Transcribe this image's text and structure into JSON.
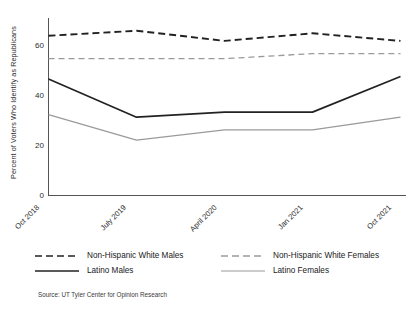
{
  "chart_data": {
    "type": "line",
    "title": "",
    "xlabel": "",
    "ylabel": "Percent of Voters Who Identify as Republicans",
    "categories": [
      "Oct 2018",
      "July 2019",
      "April 2020",
      "Jan 2021",
      "Oct 2021"
    ],
    "ylim": [
      0,
      70
    ],
    "yticks": [
      0,
      20,
      40,
      60
    ],
    "grid": false,
    "legend_position": "bottom",
    "series": [
      {
        "name": "Non-Hispanic White Males",
        "values": [
          63,
          65,
          61,
          64,
          61
        ],
        "style": "dashed",
        "color": "#222222"
      },
      {
        "name": "Non-Hispanic White Females",
        "values": [
          54,
          54,
          54,
          56,
          56
        ],
        "style": "dashed",
        "color": "#9a9a9a"
      },
      {
        "name": "Latino Males",
        "values": [
          46,
          31,
          33,
          33,
          47
        ],
        "style": "solid",
        "color": "#222222"
      },
      {
        "name": "Latino Females",
        "values": [
          32,
          22,
          26,
          26,
          31
        ],
        "style": "solid",
        "color": "#9a9a9a"
      }
    ],
    "source": "Source: UT Tyler Center for Opinion Research"
  },
  "axis": {
    "ytick_labels": [
      "60",
      "40",
      "20",
      "0"
    ],
    "xtick_labels": [
      "Oct 2018",
      "July 2019",
      "April 2020",
      "Jan 2021",
      "Oct 2021"
    ],
    "ylabel": "Percent of Voters Who Identify as Republicans"
  },
  "legend": {
    "rows": [
      {
        "left": "Non-Hispanic White Males",
        "right": "Non-Hispanic White Females"
      },
      {
        "left": "Latino Males",
        "right": "Latino Females"
      }
    ]
  },
  "footer": {
    "source": "Source: UT Tyler Center for Opinion Research"
  },
  "colors": {
    "dark": "#222222",
    "light": "#9a9a9a",
    "axis": "#444444",
    "background": "#ffffff"
  }
}
